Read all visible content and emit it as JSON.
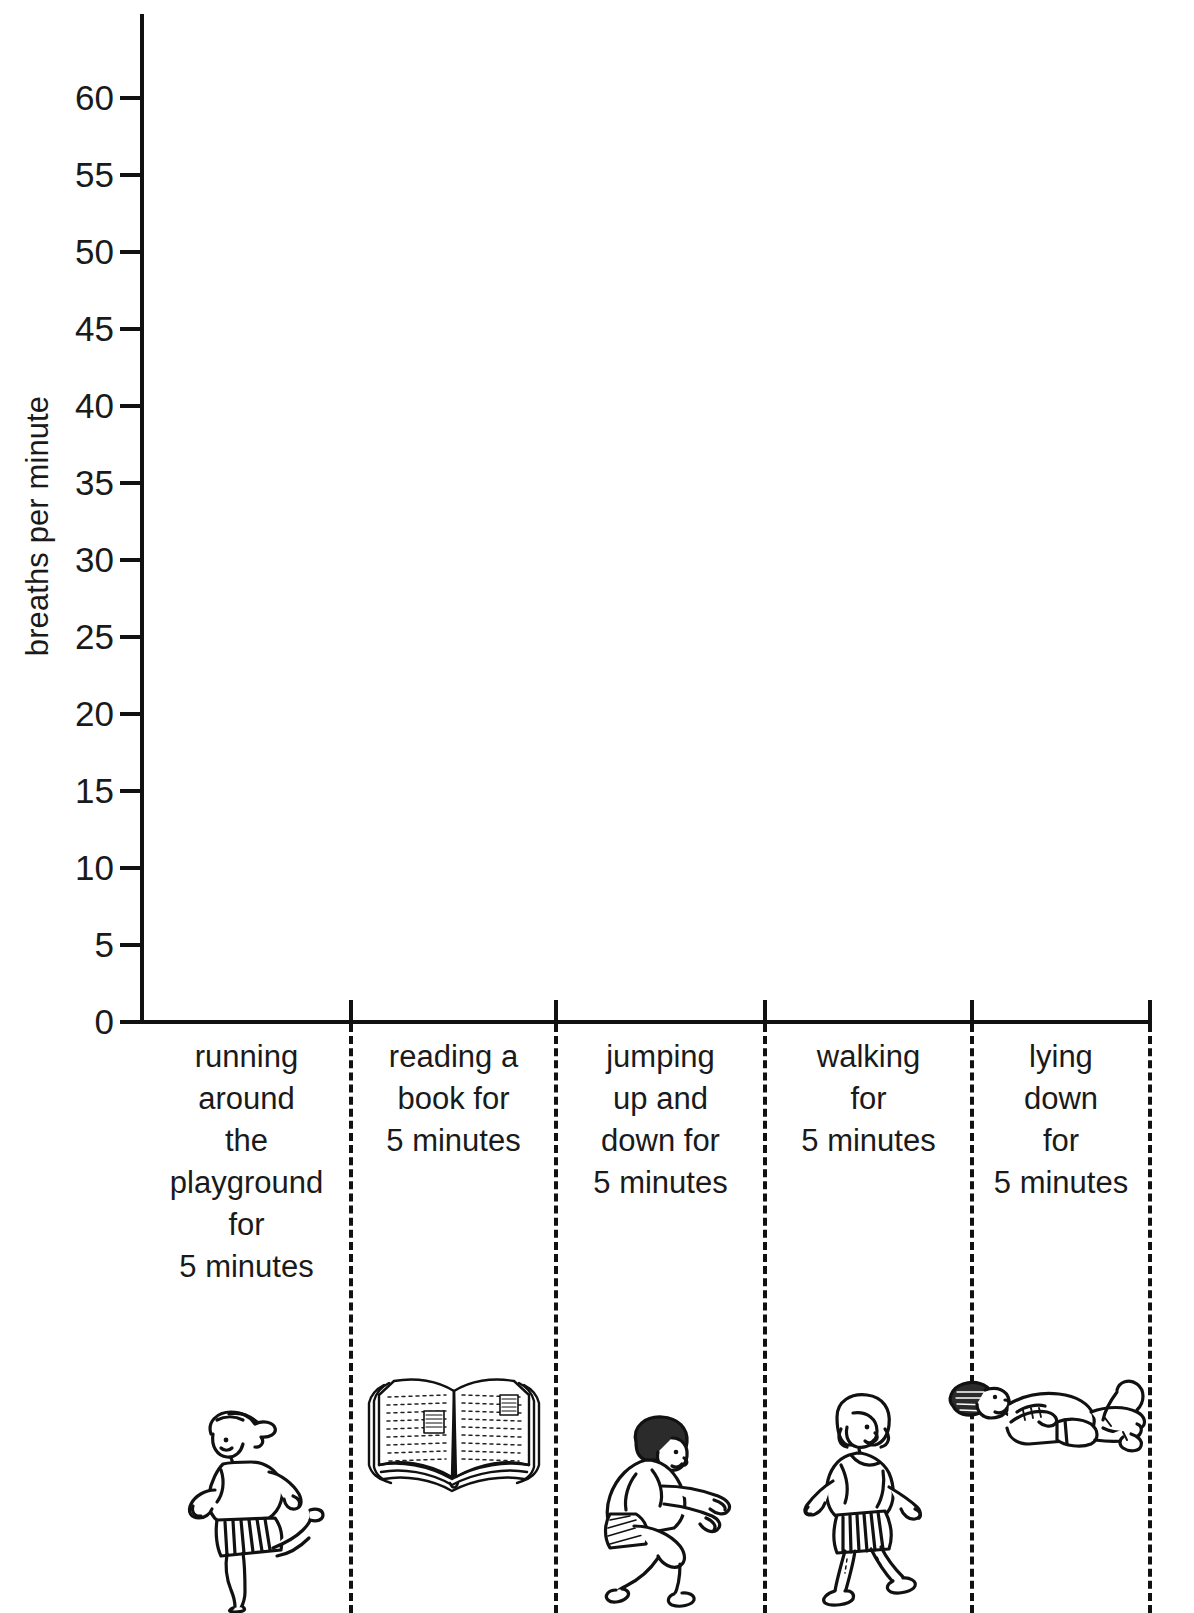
{
  "chart_data": {
    "type": "bar",
    "title": "",
    "subtitle": "",
    "xlabel": "",
    "ylabel": "breaths per minute",
    "ylim": [
      0,
      65
    ],
    "ytick_values": [
      0,
      5,
      10,
      15,
      20,
      25,
      30,
      35,
      40,
      45,
      50,
      55,
      60
    ],
    "ytick_labels": [
      "0",
      "5",
      "10",
      "15",
      "20",
      "25",
      "30",
      "35",
      "40",
      "45",
      "50",
      "55",
      "60"
    ],
    "grid": false,
    "legend": null,
    "categories": [
      "running around the playground for 5 minutes",
      "reading a book for 5 minutes",
      "jumping up and down for 5 minutes",
      "walking for 5 minutes",
      "lying down for 5 minutes"
    ],
    "values": [
      null,
      null,
      null,
      null,
      null
    ],
    "note": "blank worksheet chart - plot area empty, no bars drawn"
  },
  "axis": {
    "y_title": "breaths per minute",
    "y_ticks": [
      {
        "label": "60",
        "value": 60
      },
      {
        "label": "55",
        "value": 55
      },
      {
        "label": "50",
        "value": 50
      },
      {
        "label": "45",
        "value": 45
      },
      {
        "label": "40",
        "value": 40
      },
      {
        "label": "35",
        "value": 35
      },
      {
        "label": "30",
        "value": 30
      },
      {
        "label": "25",
        "value": 25
      },
      {
        "label": "20",
        "value": 20
      },
      {
        "label": "15",
        "value": 15
      },
      {
        "label": "10",
        "value": 10
      },
      {
        "label": "5",
        "value": 5
      },
      {
        "label": "0",
        "value": 0
      }
    ]
  },
  "categories": [
    {
      "label": "running\naround\nthe\nplayground\nfor\n5 minutes",
      "icon": "running-girl-figure"
    },
    {
      "label": "reading a\nbook for\n5 minutes",
      "icon": "open-book-figure"
    },
    {
      "label": "jumping\nup and\ndown for\n5 minutes",
      "icon": "crouching-jumping-figure"
    },
    {
      "label": "walking\nfor\n5 minutes",
      "icon": "walking-girl-figure"
    },
    {
      "label": "lying\ndown\nfor\n5 minutes",
      "icon": "lying-down-figure"
    }
  ],
  "colors": {
    "ink": "#111111",
    "background": "#ffffff"
  }
}
